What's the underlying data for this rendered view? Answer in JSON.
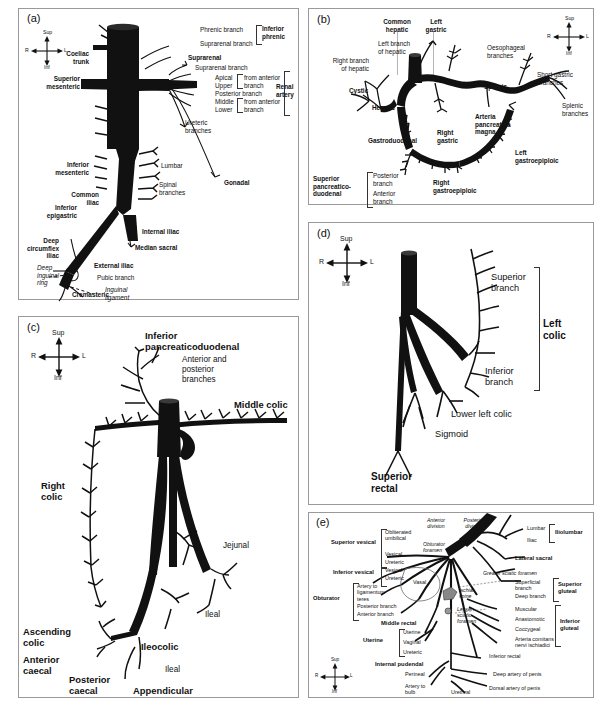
{
  "figure": {
    "panels": [
      "(a)",
      "(b)",
      "(c)",
      "(d)",
      "(e)"
    ]
  },
  "compass": {
    "sup": "Sup",
    "inf": "Inf",
    "left": "R",
    "right": "L"
  },
  "panel_a": {
    "letter": "(a)",
    "caption": "Abdominal aorta and branches",
    "labels": [
      "Phrenic branch",
      "Suprarenal branch",
      "Inferior phrenic",
      "Coeliac trunk",
      "Suprarenal",
      "Superior mesenteric",
      "Suprarenal branch",
      "Apical",
      "Upper",
      "Posterior branch",
      "Middle",
      "Lower",
      "from anterior branch",
      "from anterior branch",
      "Renal artery",
      "Ureteric branches",
      "Inferior mesenteric",
      "Lumbar",
      "Spinal branches",
      "Gonadal",
      "Common iliac",
      "Inferior epigastric",
      "Median sacral",
      "Internal iliac",
      "Deep circumflex iliac",
      "External iliac",
      "Deep inguinal ring",
      "Pubic branch",
      "Inguinal ligament",
      "Cremasteric"
    ],
    "t_phrenic_branch": "Phrenic branch",
    "t_suprarenal_branch_1": "Suprarenal branch",
    "t_inferior_phrenic": "Inferior\nphrenic",
    "t_coeliac_trunk": "Coeliac\ntrunk",
    "t_suprarenal": "Suprarenal",
    "t_superior_mesenteric": "Superior\nmesenteric",
    "t_suprarenal_branch_2": "Suprarenal branch",
    "t_apical": "Apical",
    "t_upper": "Upper",
    "t_posterior_branch": "Posterior branch",
    "t_middle": "Middle",
    "t_lower": "Lower",
    "t_from_ant_1": "from anterior\nbranch",
    "t_from_ant_2": "from anterior\nbranch",
    "t_renal_artery": "Renal\nartery",
    "t_ureteric": "Ureteric\nbranches",
    "t_inferior_mesenteric": "Inferior\nmesenteric",
    "t_lumbar": "Lumbar",
    "t_spinal": "Spinal\nbranches",
    "t_gonadal": "Gonadal",
    "t_common_iliac": "Common\niliac",
    "t_inferior_epigastric": "Inferior\nepigastric",
    "t_median_sacral": "Median sacral",
    "t_internal_iliac": "Internal iliac",
    "t_deep_circumflex": "Deep\ncircumflex\niliac",
    "t_external_iliac": "External iliac",
    "t_deep_inguinal_ring": "Deep\ninguinal\nring",
    "t_pubic_branch": "Pubic branch",
    "t_inguinal_ligament": "Inguinal\nligament",
    "t_cremasteric": "Cremasteric"
  },
  "panel_b": {
    "letter": "(b)",
    "caption": "Coeliac trunk and branches",
    "t_common_hepatic": "Common\nhepatic",
    "t_left_gastric": "Left\ngastric",
    "t_left_branch_hepatic": "Left branch\nof hepatic",
    "t_right_branch_hepatic": "Right branch\nof hepatic",
    "t_cystic": "Cystic",
    "t_hepatic": "Hepatic",
    "t_oesophageal": "Oesophageal\nbranches",
    "t_short_gastric": "Short gastric\nbranches",
    "t_splenic": "Splenic",
    "t_splenic_branches": "Splenic\nbranches",
    "t_arteria_pancreatica_magna": "Arteria\npancreatica\nmagna",
    "t_gastroduodenal": "Gastroduodenal",
    "t_right_gastric": "Right\ngastric",
    "t_left_gastroepiploic": "Left\ngastroepiploic",
    "t_right_gastroepiploic": "Right\ngastroepiploic",
    "t_superior_pancreaticoduodenal": "Superior\npancreatico-\nduodenal",
    "t_posterior_branch": "Posterior\nbranch",
    "t_anterior_branch": "Anterior\nbranch"
  },
  "panel_c": {
    "letter": "(c)",
    "caption": "Superior mesenteric artery and branches",
    "t_inferior_pancreaticoduodenal": "Inferior\npancreaticoduodenal",
    "t_anterior_posterior_branches": "Anterior and\nposterior\nbranches",
    "t_middle_colic": "Middle colic",
    "t_right_colic": "Right\ncolic",
    "t_jejunal": "Jejunal",
    "t_ileal_1": "Ileal",
    "t_ileal_2": "Ileal",
    "t_ascending_colic": "Ascending\ncolic",
    "t_ileocolic": "Ileocolic",
    "t_anterior_caecal": "Anterior\ncaecal",
    "t_posterior_caecal": "Posterior\ncaecal",
    "t_appendicular": "Appendicular"
  },
  "panel_d": {
    "letter": "(d)",
    "caption": "Inferior mesenteric artery and branches",
    "t_superior_branch": "Superior\nbranch",
    "t_inferior_branch": "Inferior\nbranch",
    "t_left_colic": "Left\ncolic",
    "t_lower_left_colic": "Lower left colic",
    "t_sigmoid": "Sigmoid",
    "t_superior_rectal": "Superior\nrectal"
  },
  "panel_e": {
    "letter": "(e)",
    "caption": "Internal iliac artery and branches",
    "t_anterior_division": "Anterior\ndivision",
    "t_posterior_division": "Posterior\ndivision",
    "t_superior_vesical": "Superior vesical",
    "t_obliterated_umbilical": "Obliterated\numbilical",
    "t_obturator_foramen": "Obturator\nforamen",
    "t_vesical_1": "Vesical",
    "t_ureteric_1": "Ureteric",
    "t_inferior_vesical": "Inferior vesical",
    "t_vesical_2": "Vesical",
    "t_ureteric_2": "Ureteric",
    "t_vasal": "Vasal",
    "t_obturator": "Obturator",
    "t_artery_to_ligamentum_teres": "Artery to\nligamentum\nteres",
    "t_posterior_branch": "Posterior branch",
    "t_anterior_branch": "Anterior branch",
    "t_middle_rectal": "Middle rectal",
    "t_uterine": "Uterine",
    "t_uterine_1": "Uterine",
    "t_vaginal": "Vaginal",
    "t_ureteric_3": "Ureteric",
    "t_internal_pudendal": "Internal pudendal",
    "t_lumbar": "Lumbar",
    "t_iliac": "Iliac",
    "t_iliolumbar": "Iliolumbar",
    "t_lateral_sacral": "Lateral sacral",
    "t_greater_sciatic_foramen": "Greater sciatic foramen",
    "t_superficial_branch": "Superficial\nbranch",
    "t_deep_branch": "Deep branch",
    "t_superior_gluteal": "Superior\ngluteal",
    "t_ischial_spine": "Ischial\nspine",
    "t_lesser_sciatic_foramen": "Lesser\nsciatic\nforamen",
    "t_muscular": "Muscular",
    "t_anastomotic": "Anastomotic",
    "t_coccygeal": "Coccygeal",
    "t_arteria_comitans": "Arteria comitans\nnervi ischiadici",
    "t_inferior_gluteal": "Inferior\ngluteal",
    "t_inferior_rectal": "Inferior rectal",
    "t_perineal": "Perineal",
    "t_artery_to_bulb": "Artery to\nbulb",
    "t_urethral": "Urethral",
    "t_deep_artery_of_penis": "Deep artery of penis",
    "t_dorsal_artery_of_penis": "Dorsal artery of penis"
  },
  "colors": {
    "vessel": "#111111",
    "panel_border": "#9a9a9a",
    "text": "#111111",
    "leader": "#333333"
  }
}
